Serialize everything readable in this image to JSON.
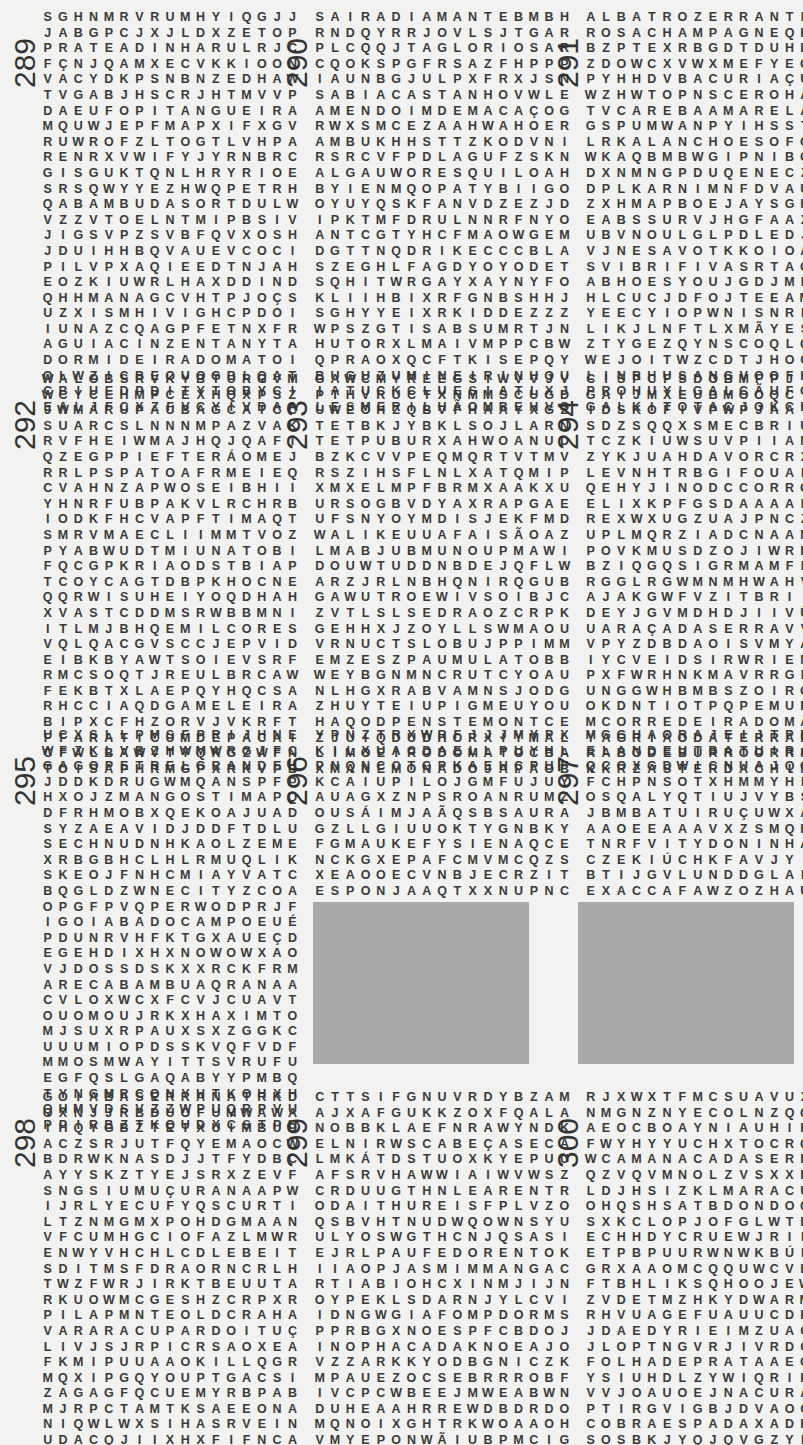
{
  "page": {
    "type": "word-search puzzle page",
    "language": "Portuguese"
  },
  "puzzles": [
    {
      "number": "289",
      "rows": [
        "SGHNMRVRUMHYIQGJJ",
        "JABGPCJXJLDXZETOP",
        "PRATEADINHARULRJC",
        "FÇNJQAMXECVKKIOON",
        "VACYDKPSNBNZEDHAW",
        "TVGABJHSCRJHTMVVP",
        "DAEUFOPITANGUEIRA",
        "MQUWJEPFMAPXIFXGV",
        "RUWROFZLTOGTLVHPA",
        "RENRXVWIFYJYRNBRC",
        "GISGUKTQNLHRYRIOE",
        "SRSQWYYEZHWQPETRH",
        "QABAMBUDASORTDULW",
        "VZZVTOELNTMIPBSIV",
        "JIGSVPZSVBFQVXOSH",
        "JDUIHHBQVAUEVCOCI",
        "PILVPXAQIEEDTNJAH",
        "EOZKIUWRLHAXDDIND",
        "QHHMANAGCVHTPJOÇS",
        "UZXISMHIVIGHCPDOI",
        "IUNAZCQAGPFETNXFR",
        "AGUIACINZENTANYTA",
        "DORMIDEIRADOMATOI",
        "OLWZICBEOUOGBLQAT",
        "CBIUEDPDITYTOBYCI",
        "EALJFCXZFVCYIVDAA"
      ],
      "found_words": [
        "PRATEADINHA",
        "PITANGUEIRA",
        "BAMBUDASORTE",
        "AGUIACINZENTA",
        "DORMIDEIRADOMATO"
      ]
    },
    {
      "number": "290",
      "rows": [
        "SAIRADIAMANTEBMBH",
        "RNDQYRRJOVLSJTGAR",
        "PLCQQJTAGLORIOSAR",
        "CQOKSPGFRSAZFHPPP",
        "IAUNBGJULPXFRXJSN",
        "SABIACASTANHOVWLE",
        "AMENDOIMDEMACAÇOG",
        "RWXSMCEZAAHWAHOER",
        "AMBUKHHSTTZKODVNI",
        "RSRCVFPDLAGUFZSKN",
        "ALGAUWORESQUILOAH",
        "BYIENMQOPATYBIIGO",
        "OYUYQSKFANVDZEZJD",
        "IPKTMFDRULNNRFNYO",
        "ANTCGTYHCFMAOWGEM",
        "DGTTNQDRIKECCCBLA",
        "SZEGHLFAGDYOYODET",
        "SQHITWRGAYXAYNYFO",
        "KLIIHBIXRFGNBSHHJ",
        "SGHYYEIXRKIDDEZZZ",
        "WPSZGTISABSUMRTJN",
        "HUTORXLMAIVMPPCBW",
        "QPRAOXQCFTKISEPQY",
        "BUGUZUMINEIRINHOU",
        "IATUCKCLUESIATLXJ",
        "LESMERILHÃOMBEHVO"
      ],
      "found_words": [
        "SAIRADIAMANTE",
        "GLORIOSA",
        "SABIACASTANHO",
        "AMENDOIMDEMACACO",
        "ESQUILO",
        "MINEIRINHO",
        "ESMERILHÃO"
      ]
    },
    {
      "number": "291",
      "rows": [
        "ALBATROZERRANTEPP",
        "ROSACHAMPAGNEQKBS",
        "BZPTEXRBGDTDUHDWD",
        "ZDOWCXVWXMEFYEGFL",
        "PYHHDVBACURIAÇUEA",
        "WZHWTOPNSCEROHADG",
        "TVCAREBAAMARELAPO",
        "GSPUMWANPYIHSSTLS",
        "LRKALANCHOESOFOAT",
        "WKAQBMBWGIPNIBOSI",
        "DXNMNGPDUQENECZVM",
        "DPLKARNIMNFDVAUEG",
        "ZXHMAPBOEJAYSGHMS",
        "EABSSURVJHGFAAXBD",
        "UBVNOULGLPDLEDJIN",
        "VJNESAVOTKKOIOARG",
        "SVIBRIFIVASRTAOAX",
        "ABHOESYOUJGDJMPBY",
        "HLCUCJDFOJTEEAMRM",
        "YEECYIOPWNISNRLAQ",
        "LIKJLNFTLXMÃYESNO",
        "ZTYGEZQYNSCOQLQCQ",
        "WEJOITWZCDTJHOCAB",
        "LINRHUSANGVOOFHYU",
        "PROHUYLGALCÃUFOKZ",
        "GALKITOTACJOKCHDF"
      ],
      "found_words": [
        "ALBATROZERRANTE",
        "ROSACHAMPAGNE",
        "BACURIAÇU",
        "CAREBAAMARELA",
        "KALANCHOE",
        "LAGOSTIM"
      ]
    },
    {
      "number": "292",
      "rows": [
        "WALOBSRVKYBTURGVM",
        "WCYCEHMPCEXHQXPSZ",
        "JWMARUPAUBAGCATCC",
        "SUARCSLNNNMPAZVAK",
        "RVFHEIWMAJHQJQAFI",
        "QZEGPPIEFTERÁOMEJ",
        "RRLPSPATOAFRMEIEQ",
        "CVAHNZAPWOSEIBHII",
        "YHNRFUBPAKVLRCHRB",
        "IODKFHCVAPFTIMAQT",
        "SMRVMAECLIIMMTVOZ",
        "PYABWUDTMIUNATOBI",
        "FQCGPKRIAODSTBIAP",
        "TCOYCAGTDBPKHOCNE",
        "QQRWISUHEIYOQDHAH",
        "XVASTCDDMSRWBBMNI",
        "ITLMJBHQEMILCORES",
        "VQLQACGVSCCJEPVID",
        "EIBKBYAWTSOIEVSRF",
        "RMCSOQTJREULBRCAW",
        "FEKBTXLAEPQYHQCSA",
        "RHCCIAQDGAMELEIRA",
        "BIPXCFHZORVJVKRFT",
        "FFARATICUMDEPACAI",
        "CFWLBAWVTYQKGZWFN",
        "TOISAPHRMGPXRKVPB"
      ],
      "found_words": [
        "MARUPAUBA",
        "MILCORES",
        "GAMELEIRA",
        "ARATICUMDEPACA"
      ]
    },
    {
      "number": "293",
      "rows": [
        "GAWCMYREEGSIWVVJV",
        "PTHVRUCTXNMMSCUGD",
        "UWEOHZQBVFHAAYXGZ",
        "TETBKJYBKLSOJLARN",
        "TETPUBURXAHWOANUD",
        "BZKCVVPEQMQRTVTMV",
        "RSZIHSFLNLXATQMIP",
        "XMXELMPFBRMXAAKXU",
        "URSOGBVDYAXRAPGAE",
        "UFSNYOYMDISJEKFMD",
        "WALIKEUUAFAISÃOAZ",
        "LMABJUBMUNOUPMAWI",
        "DOUWTUDDNBDEJQFLW",
        "ARZJRLNBHQNIRQGUB",
        "GAWUTROEWIVSOIBJC",
        "ZVTLSLSEDRAOZCRPK",
        "GEHHXJZOYLLSWMAOU",
        "VRNUCTSLOBUJPPIMM",
        "EMZESZPAUMULATOBB",
        "WEYBGNMNCRUTCYOAU",
        "NLHGXRABVAMNSJODG",
        "ZHUYTEIUPIGMEUYOU",
        "HAQODPENSTEMONTCE",
        "ZJUIQDUDHORXIYMAL",
        "LIMOEIRODOMATOCBA",
        "XMANEMONADOJAPÃOB"
      ],
      "found_words": [
        "FAISÃO",
        "PAUMULATO",
        "TEIUPIGMEU",
        "PENSTEMON",
        "LIMOEIRODOMATO",
        "ANEMONADOJAPÃO"
      ]
    },
    {
      "number": "294",
      "rows": [
        "CISPCFSDOBMFPJIRB",
        "GAIJMXEUBMOOQCIIX",
        "IDSKOFIVPWPJAAYWL",
        "SDZSQQXSMECBRIUCP",
        "TCZKIUWSUVPIIANVM",
        "ZYKJUAHDAVORCRXNO",
        "LEVNHTRBGIFOUALAP",
        "QEHYJINODCCORROMV",
        "ELIXKPFGSDAAAAPAI",
        "REXWXUGZUAJPNCZMR",
        "UPLMQRZIADCNAANTY",
        "POVKMUSDZOJIWRRXC",
        "BZIQGQSIGRMAMFPIF",
        "RGGLRGWMNMHWAHVRO",
        "AJAKGWFVZITBRIIIY",
        "DEYJGVMDHDJIIVÜVE",
        "UARAÇADASERRAVVFA",
        "VPYZDBDAOISVMYABS",
        "IYCVEIDSIRWRIENFA",
        "PXFWRHNKMAVRRGENG",
        "UNGGWHBMBSZOIRGNA",
        "OKDNTIOTPQPEMURQF",
        "MCORREDEIRADOMATO",
        "YAGRIÃODATERRAKUA",
        "RABODEBURROORRKBM",
        "KKRZASTERDACHINAG"
      ],
      "found_words": [
        "ARAÇADASERRA",
        "CORREDEIRADOMATO",
        "AGRIÃODATERRA",
        "RABODEBURRO",
        "ASTERDACHINA"
      ]
    },
    {
      "number": "295",
      "rows": [
        "UCXSLLPMSFPRIJHNE",
        "WFZKLVBZHWMWRGJFC",
        "GAGOPETRELGRANDEH",
        "JDDKDRUGWMQANSPFP",
        "HXOJZMANGOSTIMAPQ",
        "DFRHMOBXQEKOAJUAD",
        "SYZAEAVIDJDDFTDLU",
        "SECHNUDNHKAOLZEME",
        "XRBGBHCLHLRMUQLIK",
        "SKEOJFNHCMIAYVATC",
        "BQGLDZWNECITYZCOA",
        "OPGFPVQPERWODPRJF",
        "IGOIABADOCAMPOEUÉ",
        "PDUNRVHFKTGXAUEÇD",
        "EGEHDIXHXNOWOWXAO",
        "VJDOSSDSKXXRCKFRM",
        "ARECABAMBUAQRANAA",
        "CVLOXWCXFCVJCUAVT",
        "OUOMOUJRKXHAXIMTO",
        "MJSUXRPAUXSXZGGKC",
        "UUUMIOPDSSKVQFVDF",
        "MMOSMWAYITTSVRUFU",
        "EGFQSLGAQABYYPMBQ",
        "TYNGMRCQNYHTKOHXH",
        "QHMVDSVZZWPUQRPVU",
        "PPIRBZTKQUDXCSTPU"
      ],
      "found_words": [
        "PETRELGRANDE",
        "MANGOSTIM",
        "GOIABADOCAMPO",
        "ARECABAMBU"
      ]
    },
    {
      "number": "296",
      "rows": [
        "YPNZTRXWRFJJJMYPX",
        "KILXUACDAELLPUYHL",
        "PNQNCCTGPKAEHÇPUF",
        "KCAIUPILOJGMFUJUY",
        "AUAGXZNPSROANRUMZ",
        "OUSÁIMJAÃQSBSAURA",
        "GZLLGIUUOKTYGNBKY",
        "FGMAUKEFYSIENAQCE",
        "NCKGXEPAFCMVMCQZS",
        "XEAOOECVNBJECRZIT",
        "ESPONJAAQTXXNUPNC"
      ],
      "found_words": [
        "SAURA",
        "ESPONJA"
      ]
    },
    {
      "number": "297",
      "rows": [
        "MGGHAORAJEIJTPRNB",
        "ELANDEUTBATUIRAZY",
        "QCOXGDWICNUAJQGXC",
        "FCHPNSOTXHMMYHFSH",
        "OSQALYQTIUJVYBSUI",
        "JBMBATUIRUÇUWXAIN",
        "AAOEEAAAVXZSMQHRC",
        "TNRFVITYDONINHAIH",
        "CZEKIÚCHKFAVJYIRI",
        "BTIJGVLUNDDGLALIL",
        "EXACCAFAWZOZHAUWA"
      ],
      "found_words": [
        "ELANDE",
        "BATUIRA",
        "BATUIRUÇU",
        "DONINHA",
        "CHINCHILA"
      ]
    },
    {
      "number": "298",
      "rows": [
        "GOIABASERRANATRKD",
        "OXNJJRBDUOFUMWAWA",
        "IHQYGBZTETXUIMBUD",
        "ACZSRJUTFQYEMAOCW",
        "BDRWKNASDJJTFYDBC",
        "AYYSKZTYEJSRXZEVF",
        "SNGSIUMUÇURANAAPW",
        "IJRLYECUFYQSCURTI",
        "LTZNMGMXPOHDGMAAN",
        "VFCUMHGCIOFAZLMWR",
        "ENWYVHCHLCDLEBEIT",
        "SDITMSFDRAORNCRLH",
        "TWZFWRJIRKTBEUUTA",
        "RKUOWMCGESHZCRPXR",
        "PILAPMNTEOLDCRAHA",
        "VARARACUPARDOITUÇ",
        "LIVJSJRPICRSAOXEA",
        "FKMIPUUAAOKILLQGR",
        "MQXIPGQYOUPTGACSI",
        "ZAGAGFQCUEMYRBPAB",
        "MJRPCTAMTKSAEEONA",
        "NIQWLWXSIHASRVEIN",
        "UDACQJIIXHXFIFNCA",
        "TWMUKREYAGCLSXIFN",
        "KKWKTRTTWWBHTIHMA",
        "CORTIÇALISAMEKYCK"
      ],
      "found_words": [
        "GOIABASERRANA",
        "MUÇURANA",
        "ARARACUPARDO",
        "CORTIÇALISA",
        "GOIABASILVESTRE",
        "RABODEARARA",
        "ARAÇARIBANANA"
      ]
    },
    {
      "number": "299",
      "rows": [
        "CTTSIFGNUVRDYBZAM",
        "AJXAFGUKKZOXFQALA",
        "NOBBKLAEFNRAWYNDK",
        "ELNIRWSCABEÇASECA",
        "LMKÁTDSTUOXKYEPUU",
        "AFSRVHAWWIAIWVWSZ",
        "CRDUUGTHNLEARENTR",
        "ODAITHUREISFPLVZO",
        "QSBVHTNUDWQOWNSYU",
        "ULYOSWGTHCNJQSASI",
        "EJRLPAUFEDORENTOK",
        "IIAOPJASMIMMANGAC",
        "RTIABIOHCXINMJIJN",
        "OYPEKLSDARNJYLCVI",
        "IDNGWGIAFOMPDORMS",
        "PPRBGXNOESPFCBDOJ",
        "INOPHACADAKNOEAJO",
        "VZZARKKYODBGNICZK",
        "MPAUEZOCSEBRRROBF",
        "IVCPCWBEEJMWEABWN",
        "DUHEAAHRREWDBDRDO",
        "MQNOIXGHTRKWOAAOH",
        "VMYEPONWÃIUBPMCIG",
        "JPQEGVYROCLFEAEDP",
        "XYNPKUDTXÔKPZTGKE",
        "JEQUITIBAREIDAAJP"
      ],
      "found_words": [
        "CABEÇASECA",
        "PAUFEDORENTO",
        "JASMIMMANGA",
        "JEQUITIBAREI",
        "CANELACOQUEIRO",
        "SABIÁRUIVO",
        "GUASSATUNGA",
        "CAFÉDESERTÃO",
        "ROSEIRICO",
        "LOBEIRADAMATA",
        "COBRADAÁGUA"
      ]
    },
    {
      "number": "300",
      "rows": [
        "RJXWXTFMCSUAVUXFC",
        "NMGNZNYECOLNZQQAA",
        "AEOCBOAYNIAUHIRZM",
        "FWYHYYUCHXTOCRQVB",
        "WCAMANACADASERRAA",
        "QZVQVMNOLZVSXXRBR",
        "LDJHSIZKLMARACUJA",
        "OHQSHSATBDONDOQQD",
        "SXKCLOPJOFGLWTDAO",
        "ECHHDYCRUEWJRILVM",
        "ETPBPUURWNWKBÚFKA",
        "GRXAAOMCQQUWCVHPT",
        "FTBHLIKSQHOOJEWOO",
        "ZVDETMZHKYDWARMMU",
        "RHVUAGEFUAUUCDKED",
        "JDAEDYRIEIMZUACBH",
        "JLOPTNGVRJIVRDCHB",
        "FOLHADEPRATAAEGCZ",
        "YSIUHDLZYWIQRIKMN",
        "VVJOAUOEJNACURADQ",
        "PTIRGVIGBJDVAOCNH",
        "COBRAESPADAXADREZ",
        "SOSBKJYQJQVGZYFXH",
        "CVSFACUPTWSEGCAQG",
        "SAITTRRECAVALINHA",
        "EECAFSUWYITUADGUX"
      ],
      "found_words": [
        "MANACADASERRA",
        "MARACUJA",
        "FOLHADEPRATA",
        "COBRAESPADAXADREZ",
        "CAVALINHA",
        "CAMBARADOMATO",
        "TIÚVE",
        "ARARACURU"
      ]
    }
  ],
  "blank_panels": [
    {
      "position": "under-296",
      "color": "#a9a9a9"
    },
    {
      "position": "under-297",
      "color": "#a9a9a9"
    }
  ],
  "colors": {
    "background": "#f2f2f0",
    "text": "#333333",
    "blank_panel": "#a9a9a9"
  }
}
